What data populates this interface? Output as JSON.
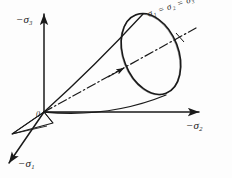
{
  "figure": {
    "background_color": "#fdfdfd",
    "ink_color": "#1a1a1a",
    "width": 232,
    "height": 178
  },
  "axes": {
    "vertical": {
      "label_prefix": "−",
      "symbol": "σ",
      "subscript": "3",
      "full_label": "−σ₃"
    },
    "horizontal": {
      "label_prefix": "−",
      "symbol": "σ",
      "subscript": "2",
      "full_label": "−σ₂"
    },
    "diagonal": {
      "label_prefix": "−",
      "symbol": "σ",
      "subscript": "1",
      "full_label": "−σ₁"
    }
  },
  "origin": {
    "label": "0"
  },
  "hydrostatic_axis": {
    "equation_sigma": "σ",
    "sub1": "1",
    "eq1": " = ",
    "sub2": "2",
    "eq2": " = ",
    "sub3": "3",
    "full_label": "σ₁ = σ₂ = σ₃",
    "line_style": "dash-dot"
  },
  "cone": {
    "apex_label": "0",
    "surface_type": "circular cone",
    "open_end_shape": "ellipse"
  }
}
